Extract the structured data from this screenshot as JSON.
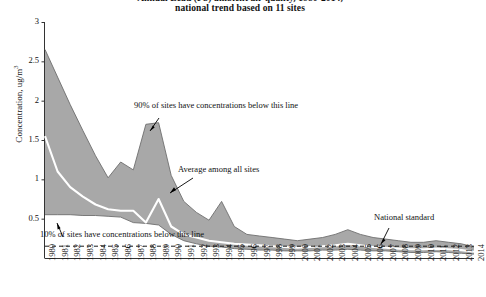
{
  "title": {
    "line1": "Annual Lead (Pb) ambient air quality, 1980-2014,",
    "line2": "national trend based on 11 sites"
  },
  "axes": {
    "ylabel": "Concentration, ug/m3",
    "yticks": [
      "0.5",
      "1",
      "1.5",
      "2",
      "2.5",
      "3"
    ],
    "ytick_values": [
      0.5,
      1,
      1.5,
      2,
      2.5,
      3
    ],
    "ylim": [
      0,
      3
    ],
    "xticks": [
      "1980",
      "1981",
      "1982",
      "1983",
      "1984",
      "1985",
      "1986",
      "1987",
      "1988",
      "1989",
      "1990",
      "1991",
      "1992",
      "1993",
      "1994",
      "1995",
      "1996",
      "1997",
      "1998",
      "1999",
      "2000",
      "2001",
      "2002",
      "2003",
      "2004",
      "2005",
      "2006",
      "2007",
      "2008",
      "2009",
      "2010",
      "2011",
      "2012",
      "2013",
      "2014"
    ]
  },
  "annotations": [
    {
      "name": "p90-label",
      "text": "90% of sites have concentrations below this line"
    },
    {
      "name": "average-label",
      "text": "Average among all sites"
    },
    {
      "name": "p10-label",
      "text": "10% of sites have concentrations below this line"
    },
    {
      "name": "national-standard-label",
      "text": "National standard"
    }
  ],
  "colors": {
    "band": "#a8a8a8",
    "band_edge": "#6e6e6e",
    "mean_line": "#ffffff",
    "standard_line": "#1a1a1a",
    "axis": "#333333",
    "text": "#111111"
  },
  "chart_data": {
    "type": "area",
    "title": "Annual Lead (Pb) ambient air quality, 1980-2014, national trend based on 11 sites",
    "xlabel": "",
    "ylabel": "Concentration, ug/m3",
    "ylim": [
      0,
      3
    ],
    "grid": false,
    "legend": "none",
    "x": [
      1980,
      1981,
      1982,
      1983,
      1984,
      1985,
      1986,
      1987,
      1988,
      1989,
      1990,
      1991,
      1992,
      1993,
      1994,
      1995,
      1996,
      1997,
      1998,
      1999,
      2000,
      2001,
      2002,
      2003,
      2004,
      2005,
      2006,
      2007,
      2008,
      2009,
      2010,
      2011,
      2012,
      2013,
      2014
    ],
    "series": [
      {
        "name": "90% of sites have concentrations below this line",
        "values": [
          2.65,
          2.3,
          1.95,
          1.62,
          1.3,
          1.02,
          1.22,
          1.12,
          1.7,
          1.72,
          1.05,
          0.72,
          0.58,
          0.48,
          0.72,
          0.4,
          0.3,
          0.28,
          0.26,
          0.24,
          0.22,
          0.24,
          0.26,
          0.3,
          0.36,
          0.3,
          0.26,
          0.24,
          0.22,
          0.2,
          0.2,
          0.22,
          0.2,
          0.18,
          0.14
        ]
      },
      {
        "name": "Average among all sites",
        "values": [
          1.55,
          1.1,
          0.9,
          0.78,
          0.68,
          0.62,
          0.6,
          0.6,
          0.45,
          0.75,
          0.4,
          0.3,
          0.26,
          0.22,
          0.2,
          0.18,
          0.17,
          0.16,
          0.15,
          0.14,
          0.13,
          0.14,
          0.15,
          0.16,
          0.18,
          0.16,
          0.14,
          0.13,
          0.12,
          0.11,
          0.11,
          0.12,
          0.11,
          0.1,
          0.08
        ]
      },
      {
        "name": "10% of sites have concentrations below this line",
        "values": [
          0.55,
          0.55,
          0.55,
          0.54,
          0.54,
          0.53,
          0.52,
          0.45,
          0.44,
          0.42,
          0.3,
          0.22,
          0.18,
          0.15,
          0.14,
          0.12,
          0.11,
          0.1,
          0.1,
          0.09,
          0.09,
          0.09,
          0.1,
          0.1,
          0.11,
          0.1,
          0.09,
          0.09,
          0.08,
          0.07,
          0.07,
          0.08,
          0.07,
          0.06,
          0.05
        ]
      }
    ],
    "reference_lines": [
      {
        "name": "National standard",
        "value": 0.15,
        "style": "dashed",
        "orientation": "horizontal"
      }
    ]
  }
}
